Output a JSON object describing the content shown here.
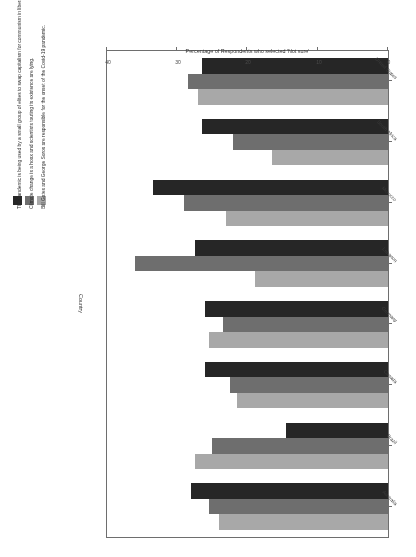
{
  "chart_data": {
    "type": "bar",
    "orientation": "horizontal-grouped",
    "title": "",
    "xlabel": "Country",
    "ylabel": "Percentage of Respondents who selected 'Not sure'",
    "ylim": [
      0,
      40
    ],
    "yticks": [
      "0",
      "10",
      "20",
      "30",
      "40"
    ],
    "grid": false,
    "legend_position": "right",
    "categories": [
      "Australia",
      "Brazil",
      "Canada",
      "Germany",
      "Lebanon",
      "Morocco",
      "South Africa",
      "United States"
    ],
    "series": [
      {
        "name": "Bill Gates and George Soros are responsible for the onset of the Covid-19 pandemic.",
        "color": "#a8a8a8",
        "values": [
          24.0,
          27.5,
          21.5,
          25.5,
          19.0,
          23.0,
          16.5,
          27.0
        ]
      },
      {
        "name": "Climate change is a hoax and scientists touting its existence are lying.",
        "color": "#6e6e6e",
        "values": [
          25.5,
          25.0,
          22.5,
          23.5,
          36.0,
          29.0,
          22.0,
          28.5
        ]
      },
      {
        "name": "The pandemic is being used by a small group of elites to swap capitalism for communism in liberal democracies.",
        "color": "#262626",
        "values": [
          28.0,
          14.5,
          26.0,
          26.0,
          27.5,
          33.5,
          26.5,
          26.5
        ]
      }
    ]
  },
  "axis": {
    "x_title": "Percentage of Respondents who selected 'Not sure'",
    "y_title": "Country"
  },
  "legend": {
    "entries": [
      {
        "label": "Bill Gates and George Soros are responsible for the onset of the Covid-19 pandemic.",
        "color": "#a8a8a8"
      },
      {
        "label": "Climate change is a hoax and scientists touting its existence are lying.",
        "color": "#6e6e6e"
      },
      {
        "label": "The pandemic is being used by a small group of elites to swap capitalism for communism in liberal democracies.",
        "color": "#262626"
      }
    ]
  }
}
